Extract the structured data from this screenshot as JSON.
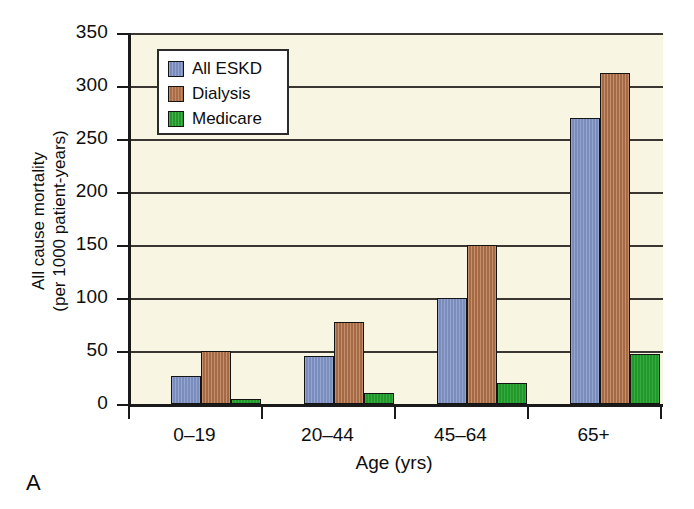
{
  "panel": {
    "label": "A"
  },
  "legend": {
    "position": "top-left-inside",
    "entries": [
      {
        "label": "All ESKD",
        "color": "#8094c6",
        "swatch_name": "legend-swatch-all-eskd"
      },
      {
        "label": "Dialysis",
        "color": "#b5744a",
        "swatch_name": "legend-swatch-dialysis"
      },
      {
        "label": "Medicare",
        "color": "#23a12c",
        "swatch_name": "legend-swatch-medicare"
      }
    ]
  },
  "axes": {
    "y_title_line1": "All cause mortality",
    "y_title_line2": "(per 1000 patient-years)",
    "x_title": "Age (yrs)",
    "y_ticks": [
      "0",
      "50",
      "100",
      "150",
      "200",
      "250",
      "300",
      "350"
    ],
    "x_ticks": [
      "0–19",
      "20–44",
      "45–64",
      "65+"
    ]
  },
  "colors": {
    "plot_background": "#f8f6e3",
    "axis": "#1a1a1a",
    "gridline": "#3a3632",
    "all_eskd": "#8094c6",
    "dialysis": "#b5744a",
    "medicare": "#23a12c",
    "legend_background": "#ffffff",
    "page_background": "#ffffff"
  },
  "chart_data": {
    "type": "bar",
    "title": "",
    "subtitle": "",
    "xlabel": "Age (yrs)",
    "ylabel": "All cause mortality (per 1000 patient-years)",
    "categories": [
      "0–19",
      "20–44",
      "45–64",
      "65+"
    ],
    "series": [
      {
        "name": "All ESKD",
        "color": "#8094c6",
        "values": [
          26,
          45,
          100,
          270
        ]
      },
      {
        "name": "Dialysis",
        "color": "#b5744a",
        "values": [
          50,
          77,
          150,
          312
        ]
      },
      {
        "name": "Medicare",
        "color": "#23a12c",
        "values": [
          5,
          10,
          20,
          47
        ]
      }
    ],
    "ylim": [
      0,
      350
    ],
    "ytick_step": 50,
    "yticks": [
      0,
      50,
      100,
      150,
      200,
      250,
      300,
      350
    ],
    "grid": true,
    "grid_axis": "y",
    "legend": true,
    "legend_position": "upper left (inside axes)",
    "panel_label": "A"
  }
}
